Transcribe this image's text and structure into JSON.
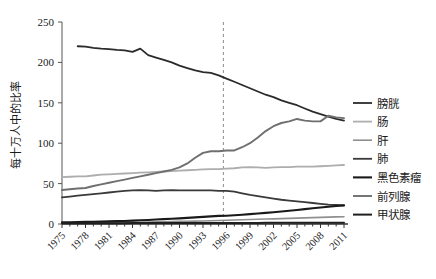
{
  "chart_data": {
    "type": "line",
    "title": "",
    "xlabel": "",
    "ylabel": "每十万人中的比率",
    "xlim": [
      1975,
      2011
    ],
    "ylim": [
      0,
      250
    ],
    "yticks": [
      0,
      50,
      100,
      150,
      200,
      250
    ],
    "xticks": [
      1975,
      1978,
      1981,
      1984,
      1987,
      1990,
      1993,
      1996,
      1999,
      2002,
      2005,
      2008,
      2011
    ],
    "grid": false,
    "legend_position": "right",
    "annotations": [
      {
        "type": "vline",
        "x": 1995.6,
        "style": "dashed",
        "color": "#8a8a8a"
      }
    ],
    "x": [
      1975,
      1976,
      1977,
      1978,
      1979,
      1980,
      1981,
      1982,
      1983,
      1984,
      1985,
      1986,
      1987,
      1988,
      1989,
      1990,
      1991,
      1992,
      1993,
      1994,
      1995,
      1996,
      1997,
      1998,
      1999,
      2000,
      2001,
      2002,
      2003,
      2004,
      2005,
      2006,
      2007,
      2008,
      2009,
      2010,
      2011
    ],
    "series": [
      {
        "name": "膀胱",
        "color": "#2b2b2b",
        "width": 1.8,
        "values": [
          null,
          null,
          220,
          219.5,
          218,
          217,
          216.5,
          215.5,
          215,
          213,
          217,
          209,
          206,
          203,
          200,
          196,
          193,
          190,
          188,
          187,
          184,
          180,
          176,
          172,
          168,
          164,
          160,
          157,
          153,
          150,
          147,
          143,
          139,
          136,
          133,
          130,
          128
        ]
      },
      {
        "name": "肠",
        "color": "#adadad",
        "width": 1.8,
        "values": [
          58,
          58.5,
          59,
          59,
          60,
          61,
          61.5,
          62,
          62.5,
          63,
          63.5,
          64,
          64.5,
          65,
          65.5,
          66,
          66.5,
          67,
          67.5,
          68,
          68,
          68.5,
          69,
          70,
          70.5,
          70,
          69.5,
          70,
          70.5,
          70.5,
          71,
          71,
          71,
          71.5,
          72,
          72.5,
          73
        ]
      },
      {
        "name": "肝",
        "color": "#8f8f8f",
        "width": 1.6,
        "values": [
          1.2,
          1.3,
          1.3,
          1.4,
          1.5,
          1.6,
          1.7,
          1.8,
          1.9,
          2.0,
          2.2,
          2.4,
          2.6,
          2.8,
          3.0,
          3.2,
          3.4,
          3.6,
          3.8,
          4.0,
          4.3,
          4.6,
          4.9,
          5.2,
          5.5,
          5.8,
          6.1,
          6.4,
          6.7,
          7.0,
          7.3,
          7.6,
          7.9,
          8.2,
          8.5,
          8.8,
          9.0
        ]
      },
      {
        "name": "肺",
        "color": "#3a3a3a",
        "width": 1.8,
        "values": [
          33,
          34,
          35,
          36,
          37,
          38,
          39,
          40,
          41,
          41.5,
          42,
          41.5,
          41,
          41.5,
          42,
          41.5,
          41.5,
          41.5,
          41.5,
          41.5,
          41,
          41,
          40,
          38,
          36,
          34.5,
          33,
          31.5,
          30,
          29,
          28,
          27,
          26,
          25,
          24,
          23.5,
          23
        ]
      },
      {
        "name": "黑色素瘤",
        "color": "#1a1a1a",
        "width": 2.1,
        "values": [
          2.0,
          2.2,
          2.4,
          2.6,
          2.8,
          3.0,
          3.2,
          3.5,
          3.8,
          4.2,
          4.6,
          5.0,
          5.5,
          6.0,
          6.5,
          7.0,
          7.6,
          8.2,
          8.8,
          9.4,
          10.0,
          10.2,
          10.8,
          11.5,
          12.2,
          13.0,
          13.8,
          14.6,
          15.5,
          16.4,
          17.4,
          18.4,
          19.4,
          20.4,
          21.4,
          22.2,
          23.0
        ]
      },
      {
        "name": "前列腺",
        "color": "#6f6f6f",
        "width": 1.9,
        "values": [
          42,
          43,
          44,
          44.5,
          47,
          49,
          51,
          53,
          55,
          57,
          59,
          61,
          63,
          65,
          67,
          70,
          75,
          82,
          88,
          90,
          90,
          91,
          91,
          95,
          100,
          107,
          115,
          121,
          125,
          127,
          130,
          128,
          127,
          127,
          134,
          132,
          131
        ]
      },
      {
        "name": "甲状腺",
        "color": "#1f1f1f",
        "width": 2.0,
        "values": [
          0.8,
          0.8,
          0.9,
          0.9,
          0.9,
          1.0,
          1.0,
          1.0,
          1.0,
          1.1,
          1.1,
          1.1,
          1.1,
          1.2,
          1.2,
          1.2,
          1.2,
          1.2,
          1.2,
          1.3,
          1.3,
          1.3,
          1.3,
          1.3,
          1.3,
          1.3,
          1.4,
          1.4,
          1.4,
          1.4,
          1.4,
          1.5,
          1.5,
          1.5,
          1.5,
          1.5,
          1.5
        ]
      }
    ]
  },
  "axis": {
    "y_title": "每十万人中的比率",
    "y_tick_labels": [
      "0",
      "50",
      "100",
      "150",
      "200",
      "250"
    ],
    "x_tick_labels": [
      "1975",
      "1978",
      "1981",
      "1984",
      "1987",
      "1990",
      "1993",
      "1996",
      "1999",
      "2002",
      "2005",
      "2008",
      "2011"
    ]
  },
  "legend": {
    "items": [
      {
        "label": "膀胱",
        "color": "#2b2b2b"
      },
      {
        "label": "肠",
        "color": "#adadad"
      },
      {
        "label": "肝",
        "color": "#8f8f8f"
      },
      {
        "label": "肺",
        "color": "#3a3a3a"
      },
      {
        "label": "黑色素瘤",
        "color": "#1a1a1a"
      },
      {
        "label": "前列腺",
        "color": "#6f6f6f"
      },
      {
        "label": "甲状腺",
        "color": "#1f1f1f"
      }
    ]
  }
}
